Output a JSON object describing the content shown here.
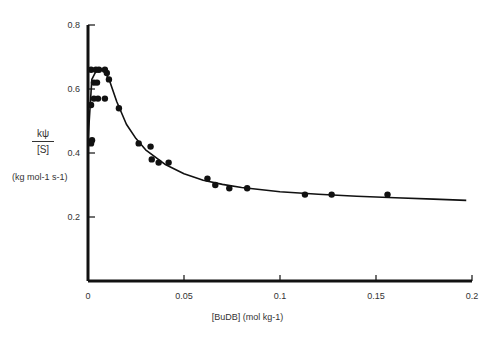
{
  "chart_data": {
    "type": "scatter",
    "title": "",
    "xlabel": "[BuDB] (mol kg-1)",
    "ylabel": "kψ / [S] (kg mol-1 s-1)",
    "xlim": [
      0,
      0.2
    ],
    "ylim": [
      0,
      0.8
    ],
    "xticks": [
      0,
      0.05,
      0.1,
      0.15,
      0.2
    ],
    "xtick_labels": [
      "0",
      "0.05",
      "0.1",
      "0.15",
      "0.2"
    ],
    "yticks": [
      0.2,
      0.4,
      0.6,
      0.8
    ],
    "ytick_labels": [
      "0.2",
      "0.4",
      "0.6",
      "0.8"
    ],
    "grid": false,
    "legend": null,
    "series": [
      {
        "name": "experimental points",
        "kind": "scatter",
        "x": [
          0.0016,
          0.0041,
          0.0057,
          0.0088,
          0.0098,
          0.0109,
          0.0031,
          0.0047,
          0.0031,
          0.0052,
          0.0088,
          0.0016,
          0.0161,
          0.0021,
          0.0016,
          0.0264,
          0.0326,
          0.0332,
          0.0368,
          0.042,
          0.0622,
          0.0663,
          0.0736,
          0.0829,
          0.113,
          0.1269,
          0.156
        ],
        "y": [
          0.66,
          0.66,
          0.66,
          0.66,
          0.65,
          0.63,
          0.62,
          0.62,
          0.57,
          0.57,
          0.57,
          0.55,
          0.54,
          0.44,
          0.43,
          0.43,
          0.42,
          0.38,
          0.37,
          0.37,
          0.32,
          0.3,
          0.29,
          0.29,
          0.27,
          0.27,
          0.27
        ]
      },
      {
        "name": "fitted curve",
        "kind": "line",
        "x": [
          0,
          0.002,
          0.005,
          0.008,
          0.011,
          0.015,
          0.02,
          0.025,
          0.03,
          0.04,
          0.05,
          0.06,
          0.07,
          0.08,
          0.1,
          0.12,
          0.14,
          0.16,
          0.18,
          0.197
        ],
        "y": [
          0.44,
          0.63,
          0.665,
          0.66,
          0.63,
          0.56,
          0.49,
          0.445,
          0.41,
          0.365,
          0.335,
          0.315,
          0.302,
          0.292,
          0.279,
          0.271,
          0.265,
          0.26,
          0.256,
          0.252
        ]
      }
    ]
  },
  "labels": {
    "y_numerator": "kψ",
    "y_denominator": "[S]",
    "y_unit": "(kg mol-1 s-1)",
    "x_axis": "[BuDB] (mol kg-1)"
  }
}
